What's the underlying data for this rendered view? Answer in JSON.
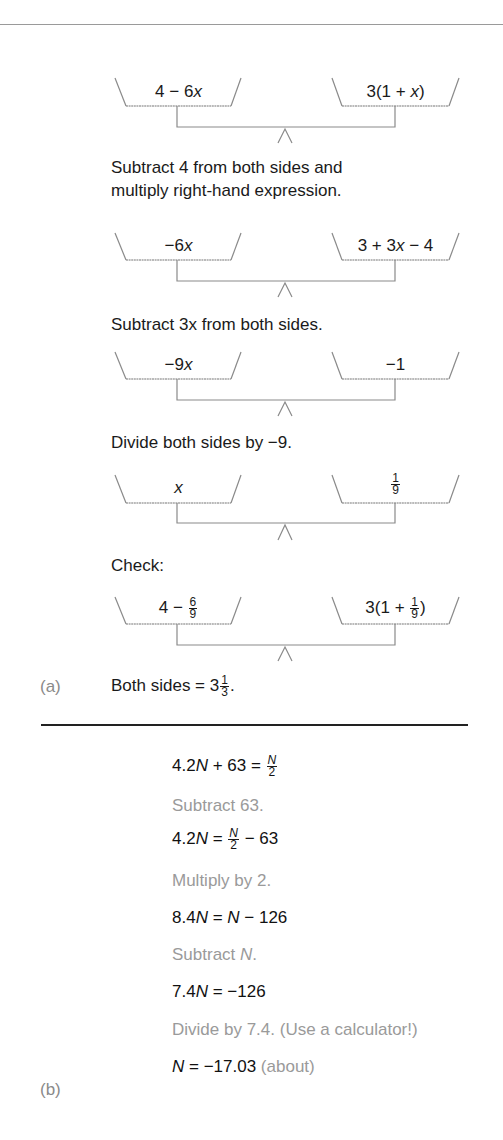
{
  "part_a": {
    "label": "(a)",
    "balances": [
      {
        "left": "4 − 6x",
        "right": "3(1 + x)"
      },
      {
        "left": "−6x",
        "right": "3 + 3x − 4"
      },
      {
        "left": "−9x",
        "right": "−1"
      },
      {
        "left": "x",
        "right": "1/9"
      },
      {
        "left": "4 − 6/9",
        "right": "3(1 + 1/9)"
      }
    ],
    "steps": [
      "Subtract 4 from both sides and",
      "multiply right-hand expression.",
      "Subtract 3x from both sides.",
      "Divide both sides by −9.",
      "Check:"
    ],
    "conclusion": "Both sides = 3 1/3."
  },
  "part_b": {
    "label": "(b)",
    "lines": [
      {
        "type": "equation",
        "text": "4.2N + 63 = N/2"
      },
      {
        "type": "hint",
        "text": "Subtract 63."
      },
      {
        "type": "equation",
        "text": "4.2N = N/2 − 63"
      },
      {
        "type": "hint",
        "text": "Multiply by 2."
      },
      {
        "type": "equation",
        "text": "8.4N = N − 126"
      },
      {
        "type": "hint",
        "text": "Subtract N."
      },
      {
        "type": "equation",
        "text": "7.4N = −126"
      },
      {
        "type": "hint",
        "text": "Divide by 7.4. (Use a calculator!)"
      },
      {
        "type": "equation",
        "text": "N = −17.03",
        "note": "(about)"
      }
    ]
  },
  "parts": {
    "b1_pre": "4.2",
    "b1_mid": " + 63 = ",
    "b2_pre": "4.2",
    "b2_mid": " = ",
    "b2_post": " − 63",
    "b3_pre": "8.4",
    "b3_mid": " = ",
    "b3_post": " − 126",
    "b4_pre": "Subtract ",
    "b4_post": ".",
    "b5_pre": "7.4",
    "b5_post": " = −126",
    "b6_post": " = −17.03 ",
    "var_N": "N",
    "two": "2",
    "one": "1",
    "nine": "9",
    "six": "6",
    "three": "3",
    "a1_left_pre": "4 − 6",
    "var_x": "x",
    "a1_right_pre": "3(1 + ",
    "a1_right_post": ")",
    "a2_left": "−6",
    "a2_right_pre": "3 + 3",
    "a2_right_post": " − 4",
    "a3_left": "−9",
    "a3_right": "−1",
    "a5_left_pre": "4 − ",
    "a5_right_pre": "3(1 + ",
    "a5_right_post": ")",
    "concl_pre": "Both sides = 3",
    "concl_post": "."
  }
}
